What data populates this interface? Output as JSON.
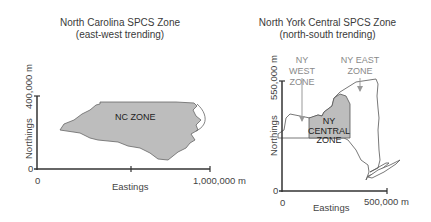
{
  "left_panel": {
    "title": "North Carolina SPCS Zone",
    "subtitle": "(east-west trending)",
    "y_axis_label": "Northings",
    "y_tick_top": "400,000 m",
    "y_tick_zero": "0",
    "x_axis_label": "Eastings",
    "x_tick_zero": "0",
    "x_tick_right": "1,000,000 m",
    "zone_label": "NC ZONE"
  },
  "right_panel": {
    "title": "North York Central SPCS Zone",
    "subtitle": "(north-south trending)",
    "y_axis_label": "Northings",
    "y_tick_top": "550,000 m",
    "y_tick_zero": "0",
    "x_axis_label": "Eastings",
    "x_tick_zero": "0",
    "x_tick_right": "500,000 m",
    "zone_label_line1": "NY",
    "zone_label_line2": "CENTRAL",
    "zone_label_line3": "ZONE",
    "west_label_line1": "NY WEST",
    "west_label_line2": "ZONE",
    "east_label_line1": "NY EAST",
    "east_label_line2": "ZONE"
  },
  "colors": {
    "zone_fill": "#bdbdbd",
    "axis": "#333333",
    "outline": "#555555",
    "callout_text": "#8a8a8a"
  }
}
